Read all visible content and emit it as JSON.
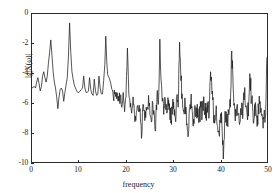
{
  "chart_data": {
    "type": "line",
    "title": "",
    "xlabel": "frequency",
    "ylabel": "lg|X(ω)|",
    "xlim": [
      0,
      50
    ],
    "ylim": [
      -10,
      0
    ],
    "xticks": [
      0,
      10,
      20,
      30,
      40,
      50
    ],
    "yticks": [
      0,
      -2,
      -4,
      -6,
      -8,
      -10
    ],
    "xtick_labels": [
      "0",
      "10",
      "20",
      "30",
      "40",
      "50"
    ],
    "ytick_labels": [
      "0",
      "-2",
      "-4",
      "-6",
      "-8",
      "-10"
    ],
    "grid": false,
    "legend": null,
    "line_color": "#1a1a1a",
    "annotations": [
      {
        "label": "major peak",
        "x": 4.0,
        "y": -1.7
      },
      {
        "label": "major peak",
        "x": 8.0,
        "y": -0.6
      },
      {
        "label": "major peak",
        "x": 15.7,
        "y": -1.5
      },
      {
        "label": "deep null",
        "x": 40.5,
        "y": -9.8
      }
    ],
    "x": [
      0.0,
      0.25,
      0.5,
      0.75,
      1.0,
      1.25,
      1.5,
      1.75,
      2.0,
      2.25,
      2.5,
      2.75,
      3.0,
      3.25,
      3.5,
      3.75,
      4.0,
      4.25,
      4.5,
      4.75,
      5.0,
      5.25,
      5.5,
      5.75,
      6.0,
      6.25,
      6.5,
      6.75,
      7.0,
      7.25,
      7.5,
      7.75,
      8.0,
      8.25,
      8.5,
      8.75,
      9.0,
      9.25,
      9.5,
      9.75,
      10.0,
      10.25,
      10.5,
      10.75,
      11.0,
      11.25,
      11.5,
      11.75,
      12.0,
      12.25,
      12.5,
      12.75,
      13.0,
      13.25,
      13.5,
      13.75,
      14.0,
      14.25,
      14.5,
      14.75,
      15.0,
      15.25,
      15.5,
      15.7,
      15.9,
      16.1,
      16.4,
      16.7,
      17.0,
      17.3,
      17.6,
      17.9,
      18.2,
      18.5,
      18.8,
      19.1,
      19.4,
      19.7,
      20.0,
      20.3,
      20.6,
      20.9,
      21.2,
      21.5,
      21.8,
      22.1,
      22.4,
      22.7,
      23.0,
      23.3,
      23.6,
      23.9,
      24.2,
      24.5,
      24.8,
      25.1,
      25.4,
      25.7,
      26.0,
      26.3,
      26.6,
      26.9,
      27.2,
      27.5,
      27.8,
      28.1,
      28.4,
      28.7,
      29.0,
      29.3,
      29.6,
      29.9,
      30.2,
      30.5,
      30.8,
      31.1,
      31.4,
      31.7,
      32.0,
      32.3,
      32.6,
      32.9,
      33.2,
      33.5,
      33.8,
      34.1,
      34.4,
      34.7,
      35.0,
      35.3,
      35.6,
      35.9,
      36.2,
      36.5,
      36.8,
      37.1,
      37.4,
      37.7,
      38.0,
      38.3,
      38.6,
      38.9,
      39.2,
      39.5,
      39.8,
      40.1,
      40.4,
      40.7,
      41.0,
      41.3,
      41.6,
      41.9,
      42.2,
      42.5,
      42.8,
      43.1,
      43.4,
      43.7,
      44.0,
      44.3,
      44.6,
      44.9,
      45.2,
      45.5,
      45.8,
      46.1,
      46.4,
      46.7,
      47.0,
      47.3,
      47.6,
      47.9,
      48.2,
      48.5,
      48.8,
      49.1,
      49.4,
      49.7,
      50.0
    ],
    "y": [
      -5.0,
      -4.95,
      -4.9,
      -5.0,
      -4.6,
      -4.3,
      -4.7,
      -5.2,
      -4.9,
      -4.2,
      -3.9,
      -4.3,
      -4.6,
      -4.2,
      -3.3,
      -2.6,
      -1.75,
      -2.8,
      -3.9,
      -4.6,
      -5.0,
      -5.6,
      -6.4,
      -5.6,
      -5.1,
      -5.0,
      -5.2,
      -5.9,
      -5.3,
      -4.8,
      -4.3,
      -2.9,
      -0.6,
      -2.6,
      -3.9,
      -4.4,
      -4.8,
      -5.0,
      -5.2,
      -5.3,
      -5.3,
      -5.2,
      -5.1,
      -5.0,
      -4.2,
      -5.0,
      -5.3,
      -5.3,
      -5.2,
      -4.3,
      -5.1,
      -5.4,
      -5.5,
      -4.4,
      -5.2,
      -5.5,
      -5.4,
      -4.2,
      -5.0,
      -5.4,
      -5.4,
      -4.5,
      -3.4,
      -1.5,
      -3.2,
      -4.1,
      -4.3,
      -4.6,
      -5.1,
      -5.6,
      -5.4,
      -5.3,
      -5.6,
      -5.9,
      -5.5,
      -6.3,
      -5.3,
      -6.6,
      -5.6,
      -2.3,
      -5.4,
      -6.3,
      -6.7,
      -5.6,
      -6.8,
      -7.2,
      -6.2,
      -6.6,
      -6.4,
      -8.4,
      -6.1,
      -6.5,
      -7.0,
      -6.3,
      -5.5,
      -6.8,
      -7.3,
      -6.0,
      -6.6,
      -7.9,
      -5.4,
      -6.1,
      -1.7,
      -4.6,
      -5.7,
      -6.3,
      -5.9,
      -6.7,
      -6.2,
      -6.6,
      -7.2,
      -6.0,
      -6.4,
      -7.0,
      -5.6,
      -6.3,
      -1.9,
      -4.5,
      -5.8,
      -6.5,
      -6.0,
      -7.5,
      -8.3,
      -6.4,
      -5.8,
      -6.6,
      -7.1,
      -6.2,
      -6.7,
      -6.4,
      -7.0,
      -6.3,
      -6.9,
      -5.6,
      -6.4,
      -7.2,
      -6.1,
      -6.8,
      -3.9,
      -5.4,
      -6.5,
      -7.3,
      -6.2,
      -7.6,
      -8.1,
      -6.9,
      -7.4,
      -9.8,
      -7.2,
      -6.6,
      -7.4,
      -6.8,
      -6.3,
      -2.5,
      -5.0,
      -6.2,
      -6.9,
      -6.1,
      -6.7,
      -7.3,
      -6.0,
      -6.5,
      -5.4,
      -6.3,
      -6.9,
      -6.1,
      -4.2,
      -5.8,
      -6.6,
      -7.0,
      -6.2,
      -7.6,
      -6.4,
      -5.9,
      -6.8,
      -7.2,
      -6.5,
      -6.9,
      -2.9
    ]
  }
}
